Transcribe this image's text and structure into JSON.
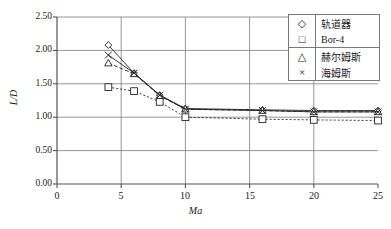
{
  "chart_data": {
    "type": "line",
    "title": "",
    "xlabel": "Ma",
    "ylabel": "L/D",
    "xlim": [
      0,
      25
    ],
    "ylim": [
      0.0,
      2.5
    ],
    "xticks": [
      "0",
      "5",
      "10",
      "15",
      "20",
      "25"
    ],
    "yticks": [
      "0.00",
      "0.50",
      "1.00",
      "1.50",
      "2.00",
      "2.50"
    ],
    "grid": "horizontal-and-vertical",
    "legend_position": "top-right",
    "series": [
      {
        "name": "轨道器",
        "marker": "diamond",
        "x": [
          4,
          6,
          8,
          10,
          16,
          20,
          25
        ],
        "values": [
          2.08,
          1.66,
          1.33,
          1.13,
          1.11,
          1.1,
          1.1
        ]
      },
      {
        "name": "Bor-4",
        "marker": "square",
        "x": [
          4,
          6,
          8,
          10,
          16,
          20,
          25
        ],
        "values": [
          1.45,
          1.39,
          1.23,
          1.0,
          0.97,
          0.96,
          0.95
        ]
      },
      {
        "name": "赫尔姆斯",
        "marker": "triangle",
        "x": [
          4,
          6,
          8,
          10,
          16,
          20,
          25
        ],
        "values": [
          1.81,
          1.65,
          1.32,
          1.12,
          1.1,
          1.08,
          1.08
        ]
      },
      {
        "name": "海姆斯",
        "marker": "cross",
        "x": [
          4,
          6,
          8,
          10,
          16,
          20,
          25
        ],
        "values": [
          1.93,
          1.66,
          1.33,
          1.12,
          1.1,
          1.08,
          1.08
        ]
      }
    ]
  },
  "axes": {
    "y_label": "L/D",
    "x_label": "Ma",
    "y_ticks": [
      "2.50",
      "2.00",
      "1.50",
      "1.00",
      "0.50",
      "0.00"
    ],
    "x_ticks": [
      "0",
      "5",
      "10",
      "15",
      "20",
      "25"
    ]
  },
  "legend": {
    "items": [
      {
        "symbol": "◇",
        "label": "轨道器"
      },
      {
        "symbol": "□",
        "label": "Bor-4"
      },
      {
        "symbol": "△",
        "label": "赫尔姆斯"
      },
      {
        "symbol": "×",
        "label": "海姆斯"
      }
    ]
  },
  "colors": {
    "axis": "#555555",
    "grid": "#8a8a8a",
    "series": "#222222",
    "background": "#ffffff"
  }
}
